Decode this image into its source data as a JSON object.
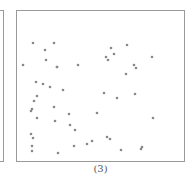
{
  "figure": {
    "caption": "(3)",
    "frame_color": "#9a9a9a",
    "point_color": "#888888"
  },
  "chart_data": {
    "type": "scatter",
    "title": "",
    "subtitle": "",
    "xlabel": "",
    "ylabel": "",
    "caption": "(3)",
    "grid": false,
    "legend": null,
    "axes_visible": false,
    "coordinate_note": "points in pixel coordinates of the plotting frame (x from left, y from top), frame spans x 16-185, y 10-162",
    "points": [
      {
        "x": 33,
        "y": 43
      },
      {
        "x": 54,
        "y": 43
      },
      {
        "x": 45,
        "y": 50
      },
      {
        "x": 46,
        "y": 60
      },
      {
        "x": 23,
        "y": 65
      },
      {
        "x": 57,
        "y": 67
      },
      {
        "x": 78,
        "y": 65
      },
      {
        "x": 36,
        "y": 82
      },
      {
        "x": 43,
        "y": 84
      },
      {
        "x": 50,
        "y": 87
      },
      {
        "x": 63,
        "y": 90
      },
      {
        "x": 37,
        "y": 96
      },
      {
        "x": 34,
        "y": 101
      },
      {
        "x": 32,
        "y": 109
      },
      {
        "x": 31,
        "y": 111
      },
      {
        "x": 37,
        "y": 118
      },
      {
        "x": 54,
        "y": 107
      },
      {
        "x": 69,
        "y": 114
      },
      {
        "x": 55,
        "y": 121
      },
      {
        "x": 70,
        "y": 125
      },
      {
        "x": 75,
        "y": 130
      },
      {
        "x": 31,
        "y": 134
      },
      {
        "x": 33,
        "y": 138
      },
      {
        "x": 32,
        "y": 146
      },
      {
        "x": 32,
        "y": 151
      },
      {
        "x": 74,
        "y": 146
      },
      {
        "x": 58,
        "y": 153
      },
      {
        "x": 111,
        "y": 48
      },
      {
        "x": 127,
        "y": 45
      },
      {
        "x": 114,
        "y": 54
      },
      {
        "x": 106,
        "y": 57
      },
      {
        "x": 108,
        "y": 60
      },
      {
        "x": 152,
        "y": 57
      },
      {
        "x": 134,
        "y": 65
      },
      {
        "x": 136,
        "y": 68
      },
      {
        "x": 126,
        "y": 74
      },
      {
        "x": 104,
        "y": 93
      },
      {
        "x": 117,
        "y": 98
      },
      {
        "x": 135,
        "y": 94
      },
      {
        "x": 97,
        "y": 113
      },
      {
        "x": 153,
        "y": 118
      },
      {
        "x": 107,
        "y": 137
      },
      {
        "x": 110,
        "y": 139
      },
      {
        "x": 92,
        "y": 141
      },
      {
        "x": 87,
        "y": 144
      },
      {
        "x": 121,
        "y": 150
      },
      {
        "x": 142,
        "y": 147
      },
      {
        "x": 141,
        "y": 149
      },
      {
        "x": 57,
        "y": 67
      }
    ]
  }
}
